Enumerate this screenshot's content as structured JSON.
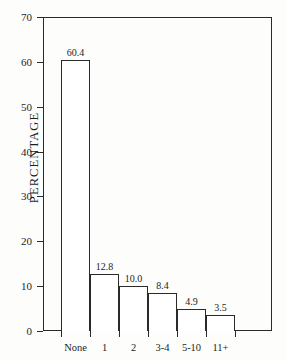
{
  "chart_data": {
    "type": "bar",
    "title": "",
    "xlabel": "",
    "ylabel": "PERCENTAGE",
    "categories": [
      "None",
      "1",
      "2",
      "3-4",
      "5-10",
      "11+"
    ],
    "values": [
      60.4,
      12.8,
      10.0,
      8.4,
      4.9,
      3.5
    ],
    "value_labels": [
      "60.4",
      "12.8",
      "10.0",
      "8.4",
      "4.9",
      "3.5"
    ],
    "ylim": [
      0,
      70
    ],
    "ytick_values": [
      0,
      10,
      20,
      30,
      40,
      50,
      60,
      70
    ],
    "ytick_labels": [
      "0",
      "10",
      "20",
      "30",
      "40",
      "50",
      "60",
      "70"
    ],
    "grid": false,
    "legend": null,
    "bar_fill_color": "#ffffff",
    "bar_edge_color": "#2a2a2a",
    "axis_color": "#2a2a2a",
    "background_color": "#fdfdfc"
  }
}
